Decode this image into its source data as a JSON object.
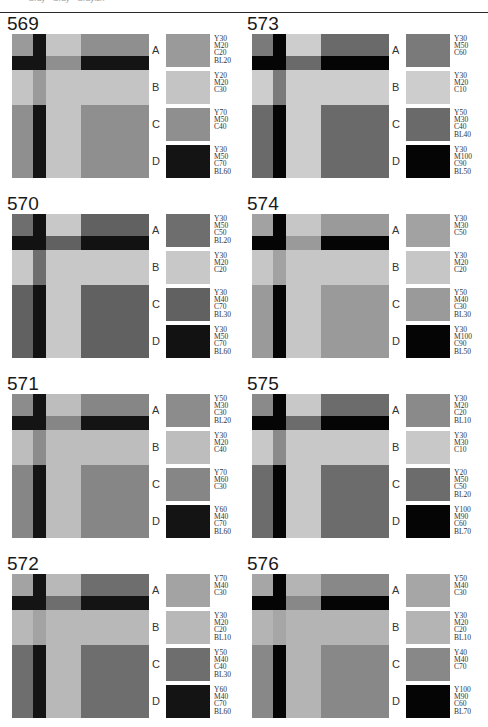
{
  "header": {
    "text": "Gray · Gray · Grayish"
  },
  "panels": [
    {
      "id": "569",
      "colors": {
        "A": "#9a9a9a",
        "B": "#c4c4c4",
        "C": "#8f8f8f",
        "D": "#141414"
      },
      "swatches": [
        {
          "letter": "A",
          "code": "Y30\nM20\nC20\nBL20"
        },
        {
          "letter": "B",
          "code": "Y20\nM20\nC30"
        },
        {
          "letter": "C",
          "code": "Y70\nM50\nC40"
        },
        {
          "letter": "D",
          "code": "Y30\nM50\nC70\nBL60"
        }
      ]
    },
    {
      "id": "573",
      "colors": {
        "A": "#7a7a7a",
        "B": "#cdcdcd",
        "C": "#6a6a6a",
        "D": "#050505"
      },
      "swatches": [
        {
          "letter": "A",
          "code": "Y30\nM50\nC60"
        },
        {
          "letter": "B",
          "code": "Y30\nM20\nC10"
        },
        {
          "letter": "C",
          "code": "Y50\nM30\nC40\nBL40"
        },
        {
          "letter": "D",
          "code": "Y30\nM100\nC90\nBL50"
        }
      ]
    },
    {
      "id": "570",
      "colors": {
        "A": "#6e6e6e",
        "B": "#c8c8c8",
        "C": "#616161",
        "D": "#121212"
      },
      "swatches": [
        {
          "letter": "A",
          "code": "Y30\nM50\nC50\nBL20"
        },
        {
          "letter": "B",
          "code": "Y30\nM20\nC20"
        },
        {
          "letter": "C",
          "code": "Y30\nM40\nC70\nBL30"
        },
        {
          "letter": "D",
          "code": "Y30\nM50\nC70\nBL60"
        }
      ]
    },
    {
      "id": "574",
      "colors": {
        "A": "#a2a2a2",
        "B": "#c6c6c6",
        "C": "#9a9a9a",
        "D": "#050505"
      },
      "swatches": [
        {
          "letter": "A",
          "code": "Y30\nM30\nC50"
        },
        {
          "letter": "B",
          "code": "Y30\nM20\nC20"
        },
        {
          "letter": "C",
          "code": "Y50\nM40\nC30\nBL30"
        },
        {
          "letter": "D",
          "code": "Y30\nM100\nC90\nBL50"
        }
      ]
    },
    {
      "id": "571",
      "colors": {
        "A": "#8c8c8c",
        "B": "#bdbdbd",
        "C": "#868686",
        "D": "#141414"
      },
      "swatches": [
        {
          "letter": "A",
          "code": "Y50\nM30\nC30\nBL20"
        },
        {
          "letter": "B",
          "code": "Y30\nM20\nC40"
        },
        {
          "letter": "C",
          "code": "Y70\nM60\nC30"
        },
        {
          "letter": "D",
          "code": "Y60\nM40\nC70\nBL60"
        }
      ]
    },
    {
      "id": "575",
      "colors": {
        "A": "#8a8a8a",
        "B": "#c8c8c8",
        "C": "#6c6c6c",
        "D": "#050505"
      },
      "swatches": [
        {
          "letter": "A",
          "code": "Y30\nM20\nC20\nBL10"
        },
        {
          "letter": "B",
          "code": "Y30\nM30\nC10"
        },
        {
          "letter": "C",
          "code": "Y20\nM50\nC50\nBL20"
        },
        {
          "letter": "D",
          "code": "Y100\nM90\nC60\nBL70"
        }
      ]
    },
    {
      "id": "572",
      "colors": {
        "A": "#a3a3a3",
        "B": "#b8b8b8",
        "C": "#6e6e6e",
        "D": "#141414"
      },
      "swatches": [
        {
          "letter": "A",
          "code": "Y70\nM40\nC30"
        },
        {
          "letter": "B",
          "code": "Y30\nM20\nC20\nBL10"
        },
        {
          "letter": "C",
          "code": "Y50\nM40\nC40\nBL30"
        },
        {
          "letter": "D",
          "code": "Y60\nM40\nC70\nBL60"
        }
      ]
    },
    {
      "id": "576",
      "colors": {
        "A": "#a6a6a6",
        "B": "#b4b4b4",
        "C": "#888888",
        "D": "#050505"
      },
      "swatches": [
        {
          "letter": "A",
          "code": "Y50\nM40\nC30"
        },
        {
          "letter": "B",
          "code": "Y30\nM20\nC20\nBL10"
        },
        {
          "letter": "C",
          "code": "Y40\nM40\nC70"
        },
        {
          "letter": "D",
          "code": "Y100\nM90\nC60\nBL70"
        }
      ]
    }
  ]
}
